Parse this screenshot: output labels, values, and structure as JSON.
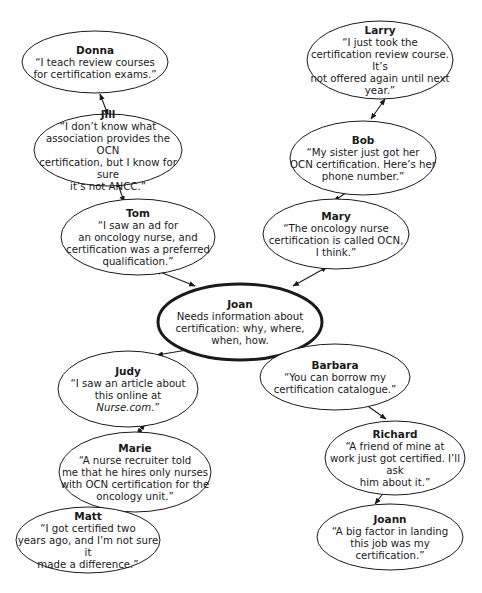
{
  "diagram": {
    "type": "network",
    "center_node": "joan",
    "nodes": [
      {
        "id": "donna",
        "name": "Donna",
        "quote": "“I teach review courses\nfor certification exams.”",
        "cx": 95,
        "cy": 62,
        "rx": 73,
        "ry": 31
      },
      {
        "id": "jill",
        "name": "Jill",
        "quote": "“I don’t know what\nassociation provides the OCN\ncertification, but I know for sure\nit’s not ANCC.”",
        "cx": 108,
        "cy": 150,
        "rx": 74,
        "ry": 36
      },
      {
        "id": "tom",
        "name": "Tom",
        "quote": "“I saw an ad for\nan oncology nurse, and\ncertification was a preferred\nqualification.”",
        "cx": 138,
        "cy": 237,
        "rx": 77,
        "ry": 38
      },
      {
        "id": "larry",
        "name": "Larry",
        "quote": "“I just took the\ncertification review course. It’s\nnot offered again until next\nyear.”",
        "cx": 380,
        "cy": 60,
        "rx": 73,
        "ry": 39
      },
      {
        "id": "bob",
        "name": "Bob",
        "quote": "“My sister just got her\nOCN certification. Here’s her\nphone number.”",
        "cx": 363,
        "cy": 158,
        "rx": 73,
        "ry": 37
      },
      {
        "id": "mary",
        "name": "Mary",
        "quote": "“The oncology nurse\ncertification is called OCN,\nI think.”",
        "cx": 336,
        "cy": 234,
        "rx": 73,
        "ry": 35
      },
      {
        "id": "joan",
        "name": "Joan",
        "quote": "Needs information about\ncertification: why, where,\nwhen, how.",
        "cx": 240,
        "cy": 322,
        "rx": 82,
        "ry": 38,
        "emphasis": true
      },
      {
        "id": "judy",
        "name": "Judy",
        "quote_prefix": "“I saw an article about\nthis online at\n",
        "quote_italic": "Nurse.com.",
        "quote_suffix": "”",
        "cx": 128,
        "cy": 389,
        "rx": 70,
        "ry": 38
      },
      {
        "id": "barbara",
        "name": "Barbara",
        "quote": "“You can borrow my\ncertification catalogue.”",
        "cx": 335,
        "cy": 377,
        "rx": 75,
        "ry": 33
      },
      {
        "id": "marie",
        "name": "Marie",
        "quote": "“A nurse recruiter told\nme that he hires only nurses\nwith OCN certification for the\noncology unit.”",
        "cx": 135,
        "cy": 472,
        "rx": 76,
        "ry": 40
      },
      {
        "id": "richard",
        "name": "Richard",
        "quote": "“A friend of mine at\nwork just got certified. I’ll ask\nhim about it.”",
        "cx": 395,
        "cy": 458,
        "rx": 70,
        "ry": 37
      },
      {
        "id": "matt",
        "name": "Matt",
        "quote": "“I got certified two\nyears ago, and I’m not sure it\nmade a difference.”",
        "cx": 88,
        "cy": 540,
        "rx": 72,
        "ry": 33
      },
      {
        "id": "joann",
        "name": "Joann",
        "quote": "“A big factor in landing\nthis job was my certification.”",
        "cx": 390,
        "cy": 537,
        "rx": 73,
        "ry": 33
      }
    ],
    "edges": [
      {
        "from": "donna",
        "to": "jill",
        "bidirectional": true,
        "x1": 100,
        "y1": 94,
        "x2": 108,
        "y2": 115
      },
      {
        "from": "jill",
        "to": "tom",
        "bidirectional": true,
        "x1": 117,
        "y1": 181,
        "x2": 124,
        "y2": 202
      },
      {
        "from": "tom",
        "to": "joan",
        "bidirectional": true,
        "x1": 155,
        "y1": 270,
        "x2": 195,
        "y2": 286
      },
      {
        "from": "larry",
        "to": "bob",
        "bidirectional": true,
        "x1": 385,
        "y1": 99,
        "x2": 371,
        "y2": 119
      },
      {
        "from": "bob",
        "to": "mary",
        "bidirectional": true,
        "x1": 356,
        "y1": 186,
        "x2": 334,
        "y2": 201
      },
      {
        "from": "mary",
        "to": "joan",
        "bidirectional": true,
        "x1": 327,
        "y1": 267,
        "x2": 293,
        "y2": 286
      },
      {
        "from": "joan",
        "to": "judy",
        "bidirectional": true,
        "x1": 199,
        "y1": 348,
        "x2": 157,
        "y2": 355
      },
      {
        "from": "joan",
        "to": "barbara",
        "bidirectional": true,
        "x1": 285,
        "y1": 348,
        "x2": 320,
        "y2": 358
      },
      {
        "from": "judy",
        "to": "marie",
        "bidirectional": true,
        "x1": 145,
        "y1": 424,
        "x2": 137,
        "y2": 434
      },
      {
        "from": "barbara",
        "to": "richard",
        "bidirectional": true,
        "x1": 362,
        "y1": 402,
        "x2": 386,
        "y2": 419
      },
      {
        "from": "marie",
        "to": "matt",
        "bidirectional": true,
        "x1": 131,
        "y1": 486,
        "x2": 93,
        "y2": 505
      },
      {
        "from": "richard",
        "to": "joann",
        "bidirectional": true,
        "x1": 391,
        "y1": 483,
        "x2": 375,
        "y2": 504
      }
    ],
    "colors": {
      "stroke": "#1a1a1a",
      "text": "#1a1a1a",
      "background": "#ffffff"
    }
  }
}
